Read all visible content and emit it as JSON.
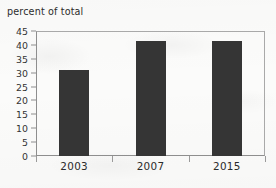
{
  "chart_data": {
    "type": "bar",
    "title": "percent of total",
    "xlabel": "",
    "ylabel": "percent of total",
    "categories": [
      "2003",
      "2007",
      "2015"
    ],
    "values": [
      31,
      41.5,
      41.5
    ],
    "ylim": [
      0,
      45
    ],
    "ytick_labels": [
      "0",
      "5",
      "10",
      "15",
      "20",
      "25",
      "30",
      "35",
      "40",
      "45"
    ],
    "ytick_values": [
      0,
      5,
      10,
      15,
      20,
      25,
      30,
      35,
      40,
      45
    ],
    "grid": false,
    "legend": null,
    "bar_color": "#353535",
    "axis_color": "#8e8e8e",
    "background_color": "#fbfbfa"
  }
}
